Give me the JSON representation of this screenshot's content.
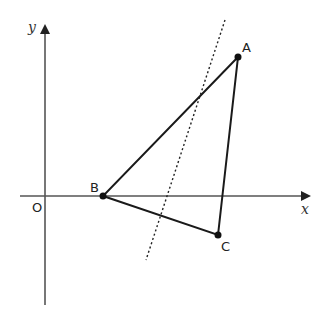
{
  "diagram": {
    "axes": {
      "x_label": "x",
      "y_label": "y",
      "origin_label": "O",
      "color": "#555555"
    },
    "points": {
      "A": {
        "label": "A",
        "x": 238,
        "y": 57
      },
      "B": {
        "label": "B",
        "x": 103,
        "y": 196
      },
      "C": {
        "label": "C",
        "x": 218,
        "y": 235
      }
    },
    "triangle": {
      "vertices": [
        "A",
        "B",
        "C"
      ],
      "color": "#1a1a1a"
    },
    "dotted_line": {
      "x1": 225,
      "y1": 20,
      "x2": 146,
      "y2": 260,
      "style": "dotted"
    }
  }
}
